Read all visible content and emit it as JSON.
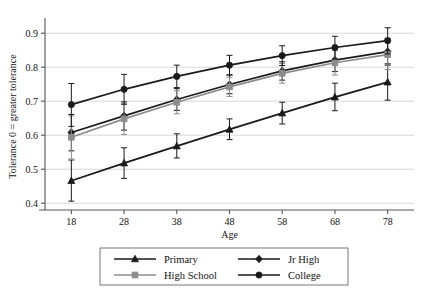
{
  "chart_data": {
    "type": "line",
    "title": "",
    "xlabel": "Age",
    "ylabel": "Tolerance 0 = greater tolerance",
    "x": [
      18,
      28,
      38,
      48,
      58,
      68,
      78
    ],
    "xlim": [
      13,
      83
    ],
    "ylim": [
      0.38,
      0.93
    ],
    "xticks": [
      "18",
      "28",
      "38",
      "48",
      "58",
      "68",
      "78"
    ],
    "yticks": [
      "0.4",
      "0.5",
      "0.6",
      "0.7",
      "0.8",
      "0.9"
    ],
    "ytick_values": [
      0.4,
      0.5,
      0.6,
      0.7,
      0.8,
      0.9
    ],
    "grid": "horizontal",
    "legend_position": "bottom",
    "error_bars": "vertical with caps",
    "series": [
      {
        "name": "Primary",
        "marker": "triangle",
        "color": "#1a1a1a",
        "values": [
          0.466,
          0.518,
          0.568,
          0.617,
          0.665,
          0.712,
          0.756
        ],
        "err_low": [
          0.406,
          0.473,
          0.533,
          0.587,
          0.633,
          0.672,
          0.703
        ],
        "err_high": [
          0.527,
          0.563,
          0.604,
          0.648,
          0.697,
          0.753,
          0.81
        ]
      },
      {
        "name": "Jr High",
        "marker": "diamond",
        "color": "#1a1a1a",
        "values": [
          0.608,
          0.657,
          0.705,
          0.749,
          0.789,
          0.821,
          0.846
        ],
        "err_low": [
          0.554,
          0.615,
          0.673,
          0.722,
          0.762,
          0.787,
          0.806
        ],
        "err_high": [
          0.661,
          0.698,
          0.737,
          0.777,
          0.816,
          0.855,
          0.885
        ]
      },
      {
        "name": "High School",
        "marker": "square",
        "color": "#8c8c8c",
        "values": [
          0.594,
          0.648,
          0.697,
          0.742,
          0.782,
          0.813,
          0.837
        ],
        "err_low": [
          0.53,
          0.602,
          0.663,
          0.714,
          0.753,
          0.777,
          0.793
        ],
        "err_high": [
          0.657,
          0.694,
          0.731,
          0.77,
          0.811,
          0.849,
          0.88
        ]
      },
      {
        "name": "College",
        "marker": "circle",
        "color": "#1a1a1a",
        "values": [
          0.69,
          0.735,
          0.773,
          0.806,
          0.834,
          0.858,
          0.878
        ],
        "err_low": [
          0.626,
          0.691,
          0.74,
          0.777,
          0.805,
          0.824,
          0.839
        ],
        "err_high": [
          0.752,
          0.779,
          0.806,
          0.835,
          0.863,
          0.891,
          0.916
        ]
      }
    ]
  },
  "legend": {
    "items": [
      {
        "label": "Primary"
      },
      {
        "label": "Jr High"
      },
      {
        "label": "High School"
      },
      {
        "label": "College"
      }
    ]
  },
  "colors": {
    "axis": "#555555",
    "grid": "#d8d8d8",
    "dark_series": "#1a1a1a",
    "gray_series": "#8c8c8c",
    "background": "#ffffff"
  }
}
